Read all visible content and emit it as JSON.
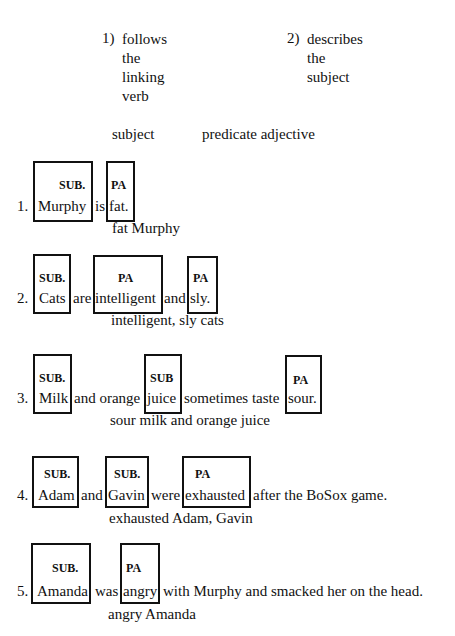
{
  "header": {
    "point1": {
      "num": "1)",
      "lines": [
        "follows",
        "the",
        "linking",
        "verb"
      ]
    },
    "point2": {
      "num": "2)",
      "lines": [
        "describes",
        "the",
        "subject"
      ]
    }
  },
  "labels": {
    "subject": "subject",
    "predicate_adjective": "predicate adjective"
  },
  "box_labels": {
    "sub": "SUB.",
    "sub_nodot": "SUB",
    "pa": "PA"
  },
  "sentences": [
    {
      "num": "1.",
      "words": [
        "Murphy",
        "is",
        "fat."
      ],
      "answer": "fat Murphy"
    },
    {
      "num": "2.",
      "words": [
        "Cats",
        "are",
        "intelligent",
        "and",
        "sly."
      ],
      "answer": "intelligent, sly cats"
    },
    {
      "num": "3.",
      "words": [
        "Milk",
        "and orange",
        "juice",
        "sometimes taste",
        "sour."
      ],
      "answer": "sour milk and orange juice"
    },
    {
      "num": "4.",
      "words": [
        "Adam",
        "and",
        "Gavin",
        "were",
        "exhausted",
        "after the BoSox game."
      ],
      "answer": "exhausted Adam, Gavin"
    },
    {
      "num": "5.",
      "words": [
        "Amanda",
        "was",
        "angry",
        "with Murphy and smacked her on the head."
      ],
      "answer": "angry Amanda"
    }
  ]
}
